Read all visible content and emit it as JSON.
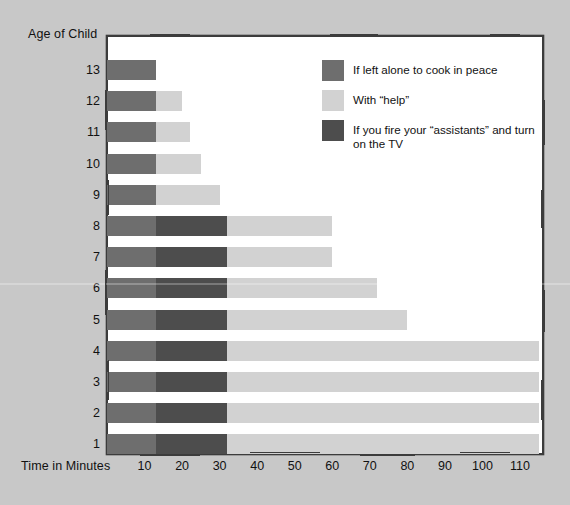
{
  "chart_data": {
    "type": "bar",
    "orientation": "horizontal",
    "stacked": true,
    "title": "",
    "xlabel": "Time in Minutes",
    "ylabel": "Age of Child",
    "xlim": [
      0,
      115
    ],
    "xticks": [
      10,
      20,
      30,
      40,
      50,
      60,
      70,
      80,
      90,
      100,
      110
    ],
    "grid": false,
    "legend_position": "top-right",
    "categories": [
      "13",
      "12",
      "11",
      "10",
      "9",
      "8",
      "7",
      "6",
      "5",
      "4",
      "3",
      "2",
      "1"
    ],
    "series": [
      {
        "name": "If left alone to cook in peace",
        "color": "#6e6e6e",
        "values": [
          13,
          13,
          13,
          13,
          13,
          13,
          13,
          13,
          13,
          13,
          13,
          13,
          13
        ]
      },
      {
        "name": "If you fire your \"assistants\" and turn on the TV",
        "color": "#4d4d4d",
        "values": [
          0,
          0,
          0,
          0,
          0,
          19,
          19,
          19,
          19,
          19,
          19,
          19,
          19
        ]
      },
      {
        "name": "With \"help\"",
        "color": "#d2d2d2",
        "values": [
          0,
          7,
          9,
          12,
          17,
          28,
          28,
          40,
          48,
          83,
          83,
          83,
          83
        ]
      }
    ],
    "totals": [
      13,
      20,
      22,
      25,
      30,
      60,
      60,
      72,
      80,
      115,
      115,
      115,
      115
    ]
  },
  "legend": {
    "items": [
      {
        "label": "If left alone to cook in peace",
        "color": "#6e6e6e"
      },
      {
        "label": "With “help”",
        "color": "#d2d2d2"
      },
      {
        "label": "If you fire your “assistants” and turn on the TV",
        "color": "#4d4d4d"
      }
    ]
  },
  "axes": {
    "y_title": "Age of Child",
    "x_title": "Time in Minutes",
    "y_ticks": [
      "13",
      "12",
      "11",
      "10",
      "9",
      "8",
      "7",
      "6",
      "5",
      "4",
      "3",
      "2",
      "1"
    ],
    "x_ticks": [
      "10",
      "20",
      "30",
      "40",
      "50",
      "60",
      "70",
      "80",
      "90",
      "100",
      "110"
    ]
  },
  "colors": {
    "background": "#c8c8c8",
    "plot_background": "#ffffff",
    "frame": "#3c3c3c",
    "text": "#111111"
  }
}
